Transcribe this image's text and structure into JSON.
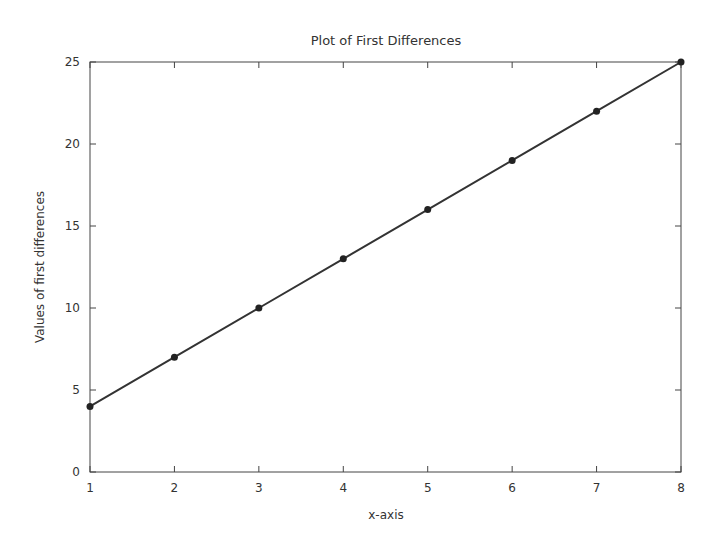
{
  "chart_data": {
    "type": "line",
    "title": "Plot of First Differences",
    "xlabel": "x-axis",
    "ylabel": "Values of first differences",
    "x": [
      1,
      2,
      3,
      4,
      5,
      6,
      7,
      8
    ],
    "series": [
      {
        "name": "first differences",
        "values": [
          4,
          7,
          10,
          13,
          16,
          19,
          22,
          25
        ],
        "color": "#333333",
        "marker": "circle"
      }
    ],
    "xlim": [
      1,
      8
    ],
    "ylim": [
      0,
      25
    ],
    "xticks": [
      "1",
      "2",
      "3",
      "4",
      "5",
      "6",
      "7",
      "8"
    ],
    "yticks": [
      "0",
      "5",
      "10",
      "15",
      "20",
      "25"
    ],
    "grid": false,
    "legend": null
  }
}
